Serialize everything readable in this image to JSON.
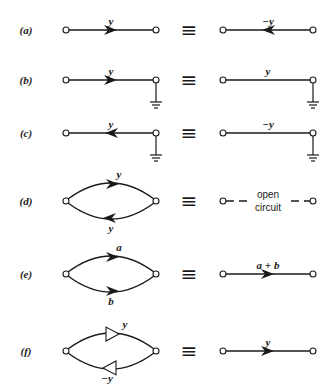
{
  "figure": {
    "equivalence_symbol": "≡",
    "rows": [
      {
        "id": "a",
        "label": "(a)",
        "left": {
          "type": "branch",
          "branch_label": "y",
          "arrow": "right",
          "arrow_style": "solid",
          "grounded_node": null
        },
        "right": {
          "type": "branch",
          "branch_label": "−y",
          "arrow": "left",
          "arrow_style": "solid",
          "grounded_node": null
        }
      },
      {
        "id": "b",
        "label": "(b)",
        "left": {
          "type": "branch",
          "branch_label": "y",
          "arrow": "right",
          "arrow_style": "solid",
          "grounded_node": "right"
        },
        "right": {
          "type": "branch",
          "branch_label": "y",
          "arrow": "none",
          "arrow_style": "none",
          "grounded_node": "right"
        }
      },
      {
        "id": "c",
        "label": "(c)",
        "left": {
          "type": "branch",
          "branch_label": "y",
          "arrow": "left",
          "arrow_style": "solid",
          "grounded_node": "right"
        },
        "right": {
          "type": "branch",
          "branch_label": "−y",
          "arrow": "none",
          "arrow_style": "none",
          "grounded_node": "right"
        }
      },
      {
        "id": "d",
        "label": "(d)",
        "left": {
          "type": "parallel",
          "upper_label": "y",
          "upper_arrow": "right",
          "lower_label": "y",
          "lower_arrow": "left",
          "arrow_style": "solid"
        },
        "right": {
          "type": "open",
          "text_top": "open",
          "text_bottom": "circuit"
        }
      },
      {
        "id": "e",
        "label": "(e)",
        "left": {
          "type": "parallel",
          "upper_label": "a",
          "upper_arrow": "right",
          "lower_label": "b",
          "lower_arrow": "right",
          "arrow_style": "solid"
        },
        "right": {
          "type": "branch",
          "branch_label": "a + b",
          "arrow": "right",
          "arrow_style": "solid",
          "grounded_node": null
        }
      },
      {
        "id": "f",
        "label": "(f)",
        "left": {
          "type": "parallel",
          "upper_label": "y",
          "upper_arrow": "right",
          "lower_label": "−y",
          "lower_arrow": "left",
          "arrow_style": "hollow"
        },
        "right": {
          "type": "branch",
          "branch_label": "y",
          "arrow": "right",
          "arrow_style": "solid",
          "grounded_node": null
        }
      }
    ]
  }
}
